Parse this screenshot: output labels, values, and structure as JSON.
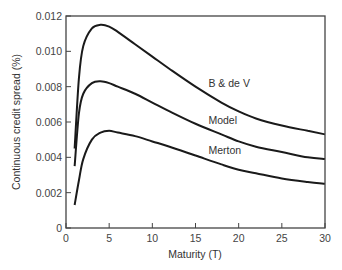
{
  "chart_data": {
    "type": "line",
    "title": "",
    "xlabel": "Maturity (T)",
    "ylabel": "Continuous credit spread (%)",
    "xlim": [
      0,
      30
    ],
    "ylim": [
      0,
      0.012
    ],
    "xticks": [
      "0",
      "5",
      "10",
      "15",
      "20",
      "25",
      "30"
    ],
    "yticks": [
      "0",
      "0.002",
      "0.004",
      "0.006",
      "0.008",
      "0.010",
      "0.012"
    ],
    "grid": false,
    "legend": "inline labels",
    "x": [
      1,
      1.5,
      2,
      3,
      4,
      5,
      6,
      8,
      10,
      12,
      15,
      18,
      20,
      22,
      25,
      28,
      30
    ],
    "series": [
      {
        "name": "B & de V",
        "values": [
          0.0045,
          0.0085,
          0.0103,
          0.0113,
          0.0115,
          0.0114,
          0.0111,
          0.0104,
          0.0097,
          0.009,
          0.008,
          0.0071,
          0.0066,
          0.0062,
          0.0058,
          0.0055,
          0.0053
        ]
      },
      {
        "name": "Model",
        "values": [
          0.0035,
          0.0065,
          0.0076,
          0.0082,
          0.0083,
          0.0082,
          0.008,
          0.0076,
          0.0071,
          0.0066,
          0.0059,
          0.0053,
          0.0049,
          0.0046,
          0.0043,
          0.004,
          0.0039
        ]
      },
      {
        "name": "Merton",
        "values": [
          0.0013,
          0.0027,
          0.0039,
          0.005,
          0.0054,
          0.0055,
          0.0054,
          0.0052,
          0.0049,
          0.0046,
          0.0041,
          0.0036,
          0.0033,
          0.0031,
          0.0028,
          0.0026,
          0.0025
        ]
      }
    ],
    "annotations": [
      {
        "text": "B & de V",
        "x": 16.5,
        "y": 0.008
      },
      {
        "text": "Model",
        "x": 16.5,
        "y": 0.0059
      },
      {
        "text": "Merton",
        "x": 16.5,
        "y": 0.0042
      }
    ]
  }
}
